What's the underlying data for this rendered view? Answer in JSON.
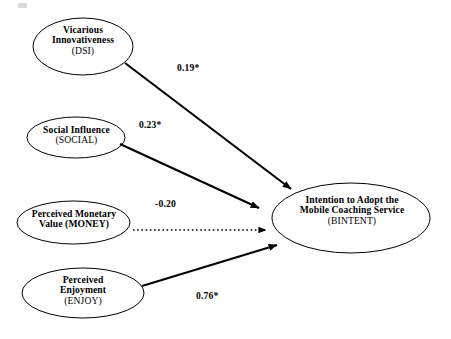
{
  "diagram": {
    "type": "path-model",
    "title": "",
    "background_color": "#ffffff",
    "stroke_color": "#000000",
    "nodes": [
      {
        "id": "DSI",
        "name": "vicarious-innovativeness",
        "line1": "Vicarious",
        "line2": "Innovativeness",
        "code": "(DSI)",
        "shape": "ellipse",
        "cx": 83,
        "cy": 46.5,
        "rx": 50,
        "ry": 28.5
      },
      {
        "id": "SOCIAL",
        "name": "social-influence",
        "line1": "Social Influence",
        "line2": "",
        "code": "(SOCIAL)",
        "shape": "ellipse",
        "cx": 76,
        "cy": 137.5,
        "rx": 49,
        "ry": 20.5
      },
      {
        "id": "MONEY",
        "name": "perceived-monetary-value",
        "line1": "Perceived Monetary",
        "line2": "Value (MONEY)",
        "code": "",
        "shape": "ellipse",
        "cx": 73.5,
        "cy": 222.5,
        "rx": 56.5,
        "ry": 21.5
      },
      {
        "id": "ENJOY",
        "name": "perceived-enjoyment",
        "line1": "Perceived",
        "line2": "Enjoyment",
        "code": "(ENJOY)",
        "shape": "ellipse",
        "cx": 83,
        "cy": 293,
        "rx": 61,
        "ry": 25
      },
      {
        "id": "BINTENT",
        "name": "intention-to-adopt",
        "line1": "Intention to Adopt the",
        "line2": "Mobile Coaching Service",
        "code": "(BINTENT)",
        "shape": "ellipse",
        "cx": 351,
        "cy": 218,
        "rx": 79,
        "ry": 35
      }
    ],
    "paths": [
      {
        "id": "p1",
        "name": "path-dsi-to-bintent",
        "from": "DSI",
        "to": "BINTENT",
        "coefficient": "0.19*",
        "significant": true,
        "style": "solid",
        "x1": 125,
        "y1": 63,
        "x2": 291,
        "y2": 189
      },
      {
        "id": "p2",
        "name": "path-social-to-bintent",
        "from": "SOCIAL",
        "to": "BINTENT",
        "coefficient": "0.23*",
        "significant": true,
        "style": "solid",
        "x1": 120,
        "y1": 144,
        "x2": 259,
        "y2": 208
      },
      {
        "id": "p3",
        "name": "path-money-to-bintent",
        "from": "MONEY",
        "to": "BINTENT",
        "coefficient": "-0.20",
        "significant": false,
        "style": "dotted",
        "x1": 133,
        "y1": 230,
        "x2": 266,
        "y2": 230
      },
      {
        "id": "p4",
        "name": "path-enjoy-to-bintent",
        "from": "ENJOY",
        "to": "BINTENT",
        "coefficient": "0.76*",
        "significant": true,
        "style": "solid",
        "x1": 142,
        "y1": 286,
        "x2": 277,
        "y2": 245
      }
    ]
  }
}
